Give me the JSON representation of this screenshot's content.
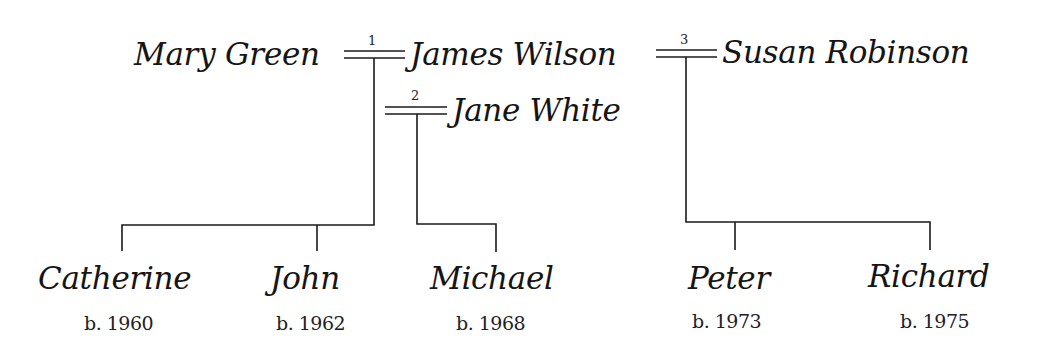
{
  "tree": {
    "parents": [
      {
        "id": "mary",
        "name": "Mary Green"
      },
      {
        "id": "james",
        "name": "James Wilson"
      },
      {
        "id": "jane",
        "name": "Jane White"
      },
      {
        "id": "susan",
        "name": "Susan Robinson"
      }
    ],
    "marriages": [
      {
        "number": "1",
        "spouses": [
          "James Wilson",
          "Mary Green"
        ]
      },
      {
        "number": "2",
        "spouses": [
          "James Wilson",
          "Jane White"
        ]
      },
      {
        "number": "3",
        "spouses": [
          "James Wilson",
          "Susan Robinson"
        ]
      }
    ],
    "children": [
      {
        "name": "Catherine",
        "born": "b. 1960",
        "marriage": "1"
      },
      {
        "name": "John",
        "born": "b. 1962",
        "marriage": "1"
      },
      {
        "name": "Michael",
        "born": "b. 1968",
        "marriage": "2"
      },
      {
        "name": "Peter",
        "born": "b. 1973",
        "marriage": "3"
      },
      {
        "name": "Richard",
        "born": "b. 1975",
        "marriage": "3"
      }
    ]
  },
  "line_color": "#1a1a1a"
}
